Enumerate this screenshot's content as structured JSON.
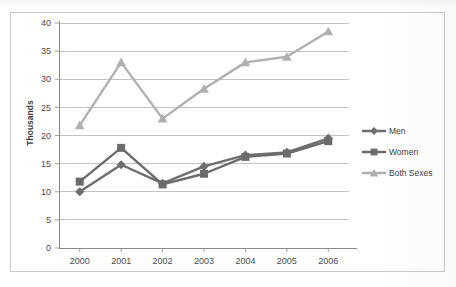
{
  "chart_data": {
    "type": "line",
    "title": "",
    "xlabel": "",
    "ylabel": "Thousands",
    "categories": [
      "2000",
      "2001",
      "2002",
      "2003",
      "2004",
      "2005",
      "2006"
    ],
    "ylim": [
      0,
      40
    ],
    "ytick_step": 5,
    "yticks": [
      "0",
      "5",
      "10",
      "15",
      "20",
      "25",
      "30",
      "35",
      "40"
    ],
    "grid": "horizontal",
    "legend_position": "right",
    "series": [
      {
        "name": "Men",
        "marker": "diamond",
        "color": "#6e6e6e",
        "values": [
          10.0,
          14.8,
          11.5,
          14.5,
          16.5,
          17.0,
          19.5
        ]
      },
      {
        "name": "Women",
        "marker": "square",
        "color": "#6b6b6b",
        "values": [
          11.8,
          17.8,
          11.3,
          13.2,
          16.2,
          16.8,
          19.0
        ]
      },
      {
        "name": "Both Sexes",
        "marker": "triangle",
        "color": "#b0b0b0",
        "values": [
          21.8,
          33.0,
          23.0,
          28.3,
          33.0,
          34.0,
          38.5
        ]
      }
    ]
  },
  "legend": {
    "items": [
      {
        "label": "Men"
      },
      {
        "label": "Women"
      },
      {
        "label": "Both Sexes"
      }
    ]
  },
  "colors": {
    "frame_border": "#c9c9c9",
    "gridline": "#a9a9a9",
    "axis_line": "#8a8a8a",
    "tick_text": "#4a4a4a",
    "series_men": "#6e6e6e",
    "series_women": "#6b6b6b",
    "series_both": "#b0b0b0",
    "background": "#ffffff"
  }
}
